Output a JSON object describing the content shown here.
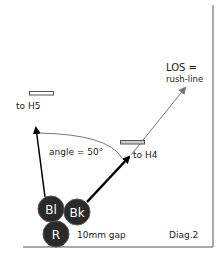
{
  "diagram": {
    "caption": "Diag.2",
    "labels": {
      "los_line1": "LOS =",
      "los_line2": "rush-line",
      "to_h5": "to H5",
      "to_h4": "to H4",
      "angle": "angle = 50°",
      "gap": "10mm gap"
    },
    "balls": [
      {
        "id": "Bl",
        "label": "Bl"
      },
      {
        "id": "Bk",
        "label": "Bk"
      },
      {
        "id": "R",
        "label": "R"
      }
    ],
    "colors": {
      "ball_fill": "#2a2a2a",
      "ball_stroke": "#555555",
      "arrow_dark": "#000000",
      "arrow_gray": "#777777",
      "border": "#555555"
    }
  }
}
